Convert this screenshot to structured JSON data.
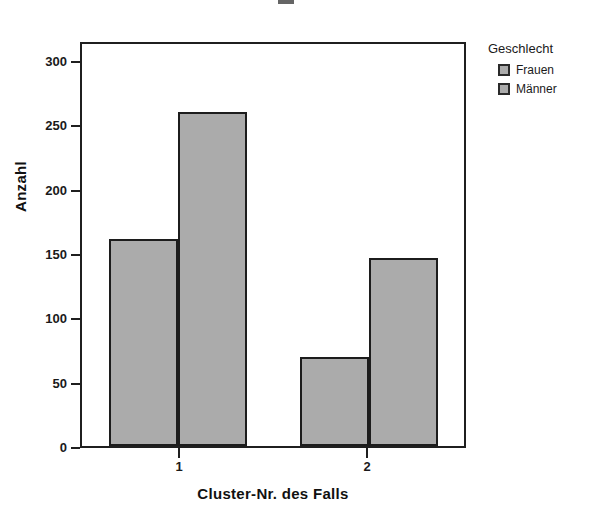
{
  "chart_data": {
    "type": "bar",
    "title": "",
    "xlabel": "Cluster-Nr. des Falls",
    "ylabel": "Anzahl",
    "categories": [
      "1",
      "2"
    ],
    "series": [
      {
        "name": "Frauen",
        "values": [
          162,
          70
        ]
      },
      {
        "name": "Männer",
        "values": [
          262,
          147
        ]
      }
    ],
    "ylim": [
      0,
      315
    ],
    "yticks": [
      0,
      50,
      100,
      150,
      200,
      250,
      300
    ],
    "ytick_labels": [
      "0",
      "50",
      "100",
      "150",
      "200",
      "250",
      "300"
    ],
    "grid": false,
    "legend": {
      "title": "Geschlecht",
      "position": "right",
      "entries": [
        "Frauen",
        "Männer"
      ]
    },
    "colors": {
      "bar_fill": "#ababab",
      "bar_border": "#1c1c1c",
      "axis": "#1f1f1f",
      "text": "#1a1a1a",
      "background": "#ffffff"
    }
  },
  "axes": {
    "y_title": "Anzahl",
    "x_title": "Cluster-Nr. des Falls",
    "y_ticks": [
      {
        "label": "300",
        "value": 300
      },
      {
        "label": "250",
        "value": 250
      },
      {
        "label": "200",
        "value": 200
      },
      {
        "label": "150",
        "value": 150
      },
      {
        "label": "100",
        "value": 100
      },
      {
        "label": "50",
        "value": 50
      },
      {
        "label": "0",
        "value": 0
      }
    ],
    "x_ticks": [
      {
        "label": "1"
      },
      {
        "label": "2"
      }
    ]
  },
  "legend": {
    "title": "Geschlecht",
    "items": [
      {
        "label": "Frauen"
      },
      {
        "label": "Männer"
      }
    ]
  }
}
